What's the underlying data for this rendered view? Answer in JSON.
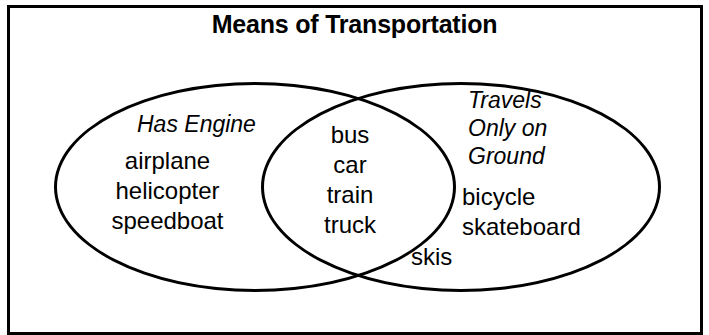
{
  "title": "Means of Transportation",
  "diagram": {
    "type": "venn-2-set",
    "left_set": {
      "label": "Has Engine",
      "items": [
        "airplane",
        "helicopter",
        "speedboat"
      ]
    },
    "right_set": {
      "label_lines": [
        "Travels",
        "Only on",
        "Ground"
      ],
      "label": "Travels Only on Ground",
      "items": [
        "bicycle",
        "skateboard"
      ],
      "items_extra": [
        "skis"
      ]
    },
    "intersection": {
      "items": [
        "bus",
        "car",
        "train",
        "truck"
      ]
    },
    "stroke_color": "#000000",
    "background_color": "#ffffff"
  }
}
